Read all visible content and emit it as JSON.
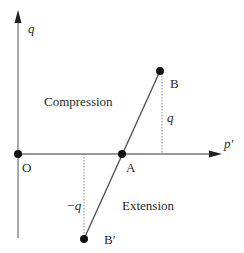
{
  "diagram": {
    "title": "",
    "axes": {
      "vertical_label": "q",
      "horizontal_label": "p′"
    },
    "points": {
      "origin": "O",
      "a": "A",
      "b": "B",
      "b_prime": "B′"
    },
    "regions": {
      "upper": "Compression",
      "lower": "Extension"
    },
    "offsets": {
      "b_height": "q",
      "b_prime_depth": "−q"
    },
    "colors": {
      "line": "#555555",
      "point": "#111111",
      "text": "#2a2a2a"
    }
  }
}
